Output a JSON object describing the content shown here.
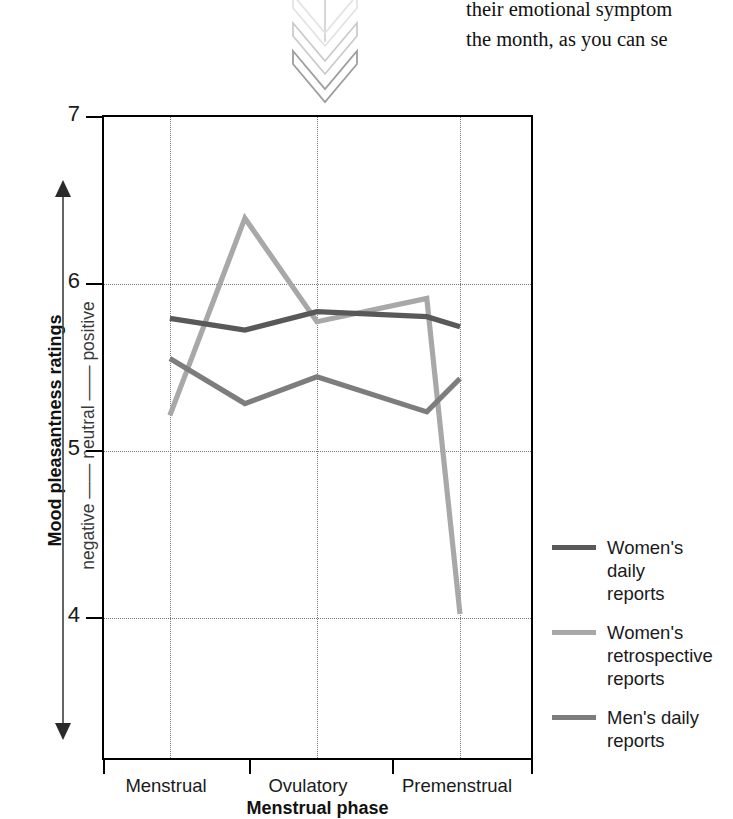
{
  "page_text": {
    "line1": "their emotional symptom",
    "line2": "the month, as you can se"
  },
  "ornament": {
    "name": "double-chevron-down"
  },
  "chart_data": {
    "type": "line",
    "title": "",
    "subtitle": "",
    "xlabel": "Menstrual phase",
    "ylabel": "Mood pleasantness ratings",
    "y_scale_annotation": "negative —— neutral —— positive",
    "categories": [
      "Menstrual",
      "Ovulatory",
      "Premenstrual"
    ],
    "x_positions": [
      0.0,
      0.34,
      0.675,
      1.0
    ],
    "x_tick_labels": [
      "Menstrual",
      "Ovulatory",
      "Premenstrual"
    ],
    "yticks": [
      7,
      6,
      5,
      4
    ],
    "ylim": [
      3.3,
      7.0
    ],
    "grid": "vertical-at-categories, horizontal-at-yticks",
    "legend_position": "right",
    "series": [
      {
        "name": "Women's daily reports",
        "legend_label": "Women's\ndaily\nreports",
        "color": "#595959",
        "x": [
          0.153,
          0.327,
          0.494,
          0.749,
          0.826
        ],
        "values": [
          5.8,
          5.73,
          5.84,
          5.81,
          5.75
        ]
      },
      {
        "name": "Women's retrospective reports",
        "legend_label": "Women's\nretrospective\nreports",
        "color": "#a8a8a8",
        "x": [
          0.153,
          0.327,
          0.494,
          0.749,
          0.826
        ],
        "values": [
          5.22,
          6.4,
          5.78,
          5.92,
          4.03
        ]
      },
      {
        "name": "Men's daily reports",
        "legend_label": "Men's daily\nreports",
        "color": "#7d7d7d",
        "x": [
          0.153,
          0.327,
          0.494,
          0.749,
          0.826
        ],
        "values": [
          5.56,
          5.29,
          5.45,
          5.24,
          5.44
        ]
      }
    ]
  },
  "legend": {
    "entries": [
      {
        "label": "Women's daily reports",
        "color": "#595959"
      },
      {
        "label": "Women's retrospective reports",
        "color": "#a8a8a8"
      },
      {
        "label": "Men's daily reports",
        "color": "#7d7d7d"
      }
    ]
  }
}
